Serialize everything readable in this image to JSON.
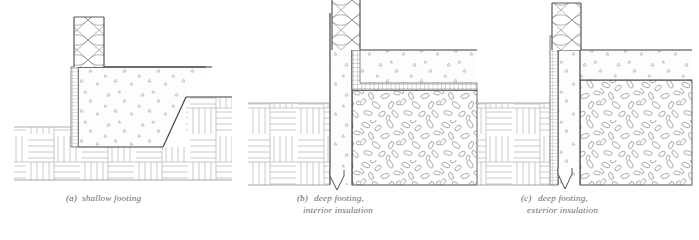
{
  "figure": {
    "background_color": "#ffffff",
    "line_color": "#4a4a4a",
    "hatch_color": "#8a8a8a",
    "caption_color": "#6b6b6b",
    "width": 699,
    "height": 240
  },
  "panels": [
    {
      "id": "a",
      "letter": "(a)",
      "caption_line1": "shallow footing",
      "caption_line2": "",
      "caption_x": 155,
      "caption_y": 200,
      "description": "Shallow footing section with framed wall above, batt insulation, concrete foundation wall and footing, sloped earth grade on right, earth hatching below"
    },
    {
      "id": "b",
      "letter": "(b)",
      "caption_line1": "deep footing,",
      "caption_line2": "interior insulation",
      "caption_x": 300,
      "caption_y": 200,
      "description": "Deep footing section with rigid insulation applied on interior face of concrete wall and under slab, gravel fill at right, break line at bottom"
    },
    {
      "id": "c",
      "letter": "(c)",
      "caption_line1": "deep footing,",
      "caption_line2": "exterior insulation",
      "caption_x": 525,
      "caption_y": 200,
      "description": "Deep footing section with rigid insulation applied on exterior face of concrete wall, gravel fill at right, break line at bottom"
    }
  ],
  "materials": [
    {
      "key": "batt-insulation",
      "label": "batt insulation",
      "pattern": "bowtie-x"
    },
    {
      "key": "rigid-insulation",
      "label": "rigid insulation",
      "pattern": "grid-hatch"
    },
    {
      "key": "concrete",
      "label": "concrete",
      "pattern": "triangle-stipple"
    },
    {
      "key": "earth",
      "label": "earth",
      "pattern": "parquet-lines"
    },
    {
      "key": "gravel",
      "label": "gravel fill",
      "pattern": "aggregate"
    }
  ],
  "footer_note": ""
}
